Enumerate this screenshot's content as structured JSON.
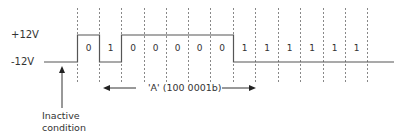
{
  "levels": {
    "high_label": "+12V",
    "low_label": "-12V"
  },
  "character": {
    "label": "'A' (100 0001b)"
  },
  "inactive": {
    "line1": "Inactive",
    "line2": "condition"
  },
  "bits": [
    "0",
    "1",
    "0",
    "0",
    "0",
    "0",
    "0",
    "1",
    "1",
    "1",
    "1",
    "1",
    "1"
  ],
  "colors": {
    "line": "#555555",
    "dash": "#888888",
    "text": "#333333"
  }
}
